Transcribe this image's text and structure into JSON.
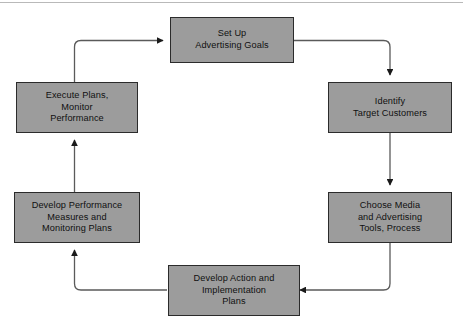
{
  "diagram": {
    "type": "cyclical-process-flowchart",
    "orientation": "clockwise",
    "colors": {
      "node_fill": "#9c9c9c",
      "node_border": "#2b2b2b",
      "connector": "#5a5a5a",
      "arrowhead": "#1a1a1a",
      "background": "#ffffff",
      "top_rule": "#b9b9b9"
    },
    "nodes": [
      {
        "id": "set-up-advertising-goals",
        "label": "Set Up\nAdvertising Goals",
        "position": "top-center",
        "order": 1
      },
      {
        "id": "identify-target-customers",
        "label": "Identify\nTarget Customers",
        "position": "right-upper",
        "order": 2
      },
      {
        "id": "choose-media-and-advertising-tools-process",
        "label": "Choose Media\nand Advertising\nTools, Process",
        "position": "right-lower",
        "order": 3
      },
      {
        "id": "develop-action-and-implementation-plans",
        "label": "Develop Action and\nImplementation\nPlans",
        "position": "bottom-center",
        "order": 4
      },
      {
        "id": "develop-performance-measures-and-monitoring-plans",
        "label": "Develop Performance\nMeasures and\nMonitoring Plans",
        "position": "left-lower",
        "order": 5
      },
      {
        "id": "execute-plans-monitor-performance",
        "label": "Execute Plans,\nMonitor\nPerformance",
        "position": "left-upper",
        "order": 6
      }
    ],
    "connectors": [
      {
        "id": "goals-to-identify",
        "from": "set-up-advertising-goals",
        "to": "identify-target-customers"
      },
      {
        "id": "identify-to-choose-media",
        "from": "identify-target-customers",
        "to": "choose-media-and-advertising-tools-process"
      },
      {
        "id": "choose-media-to-develop-action",
        "from": "choose-media-and-advertising-tools-process",
        "to": "develop-action-and-implementation-plans"
      },
      {
        "id": "develop-action-to-performance-measures",
        "from": "develop-action-and-implementation-plans",
        "to": "develop-performance-measures-and-monitoring-plans"
      },
      {
        "id": "performance-measures-to-execute-plans",
        "from": "develop-performance-measures-and-monitoring-plans",
        "to": "execute-plans-monitor-performance"
      },
      {
        "id": "execute-plans-to-goals",
        "from": "execute-plans-monitor-performance",
        "to": "set-up-advertising-goals"
      }
    ]
  }
}
